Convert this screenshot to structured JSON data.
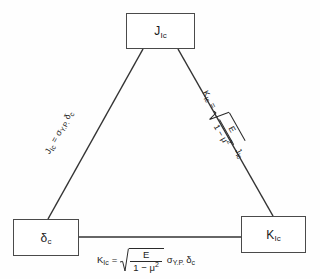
{
  "diagram": {
    "type": "triangle-relationship",
    "background_color": "#fefefe",
    "line_color": "#333333",
    "text_color": "#1a1a1a"
  },
  "nodes": [
    {
      "id": "j-ic",
      "symbol": "J",
      "subscript": "Ic",
      "position": "top"
    },
    {
      "id": "delta-c",
      "symbol": "δ",
      "subscript": "c",
      "position": "bottom-left"
    },
    {
      "id": "k-ic",
      "symbol": "K",
      "subscript": "Ic",
      "position": "bottom-right"
    }
  ],
  "edges": [
    {
      "id": "edge-left",
      "from": "delta-c",
      "to": "j-ic",
      "label": {
        "lhs_symbol": "J",
        "lhs_sub": "Ic",
        "equals": "=",
        "rhs_terms": [
          "σ",
          "Y.P.",
          "δ",
          "c"
        ],
        "plain": "J_Ic = σ_Y.P. δ_c"
      },
      "rotation_deg": -62
    },
    {
      "id": "edge-right",
      "from": "j-ic",
      "to": "k-ic",
      "label": {
        "lhs_symbol": "K",
        "lhs_sub": "Ic",
        "equals": "=",
        "radical": true,
        "numerator": "E",
        "denominator_base": "1 − μ",
        "denominator_exp": "2",
        "trailing_symbol": "J",
        "trailing_sub": "Ic",
        "plain": "K_Ic = √(E / (1 − μ²)) J_Ic"
      },
      "rotation_deg": 62
    },
    {
      "id": "edge-bottom",
      "from": "delta-c",
      "to": "k-ic",
      "label": {
        "lhs_symbol": "K",
        "lhs_sub": "Ic",
        "equals": "=",
        "radical": true,
        "numerator": "E",
        "denominator_base": "1 − μ",
        "denominator_exp": "2",
        "trailing_symbol": "σ",
        "trailing_sub": "Y.P.",
        "trailing_symbol_2": "δ",
        "trailing_sub_2": "c",
        "plain": "K_Ic = √(E / (1 − μ²)) σ_Y.P. δ_c"
      },
      "rotation_deg": 0
    }
  ]
}
